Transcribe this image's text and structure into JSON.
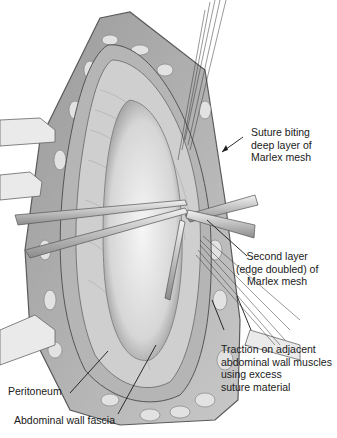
{
  "figure": {
    "colors": {
      "ink": "#1a1a1a",
      "tissue_dark": "#6e6e6e",
      "tissue_mid": "#a8a8a8",
      "tissue_light": "#e6e6e6",
      "background": "#ffffff"
    }
  },
  "labels": [
    {
      "id": "suture-biting",
      "lines": [
        "Suture biting",
        "deep layer of",
        "Marlex mesh"
      ]
    },
    {
      "id": "second-layer",
      "lines": [
        "Second layer",
        "(edge doubled) of",
        "Marlex mesh"
      ]
    },
    {
      "id": "traction",
      "lines": [
        "Traction on adjacent",
        "abdominal wall muscles",
        "using excess",
        "suture material"
      ]
    },
    {
      "id": "peritoneum",
      "lines": [
        "Peritoneum"
      ]
    },
    {
      "id": "fascia",
      "lines": [
        "Abdominal wall fascia"
      ]
    }
  ]
}
